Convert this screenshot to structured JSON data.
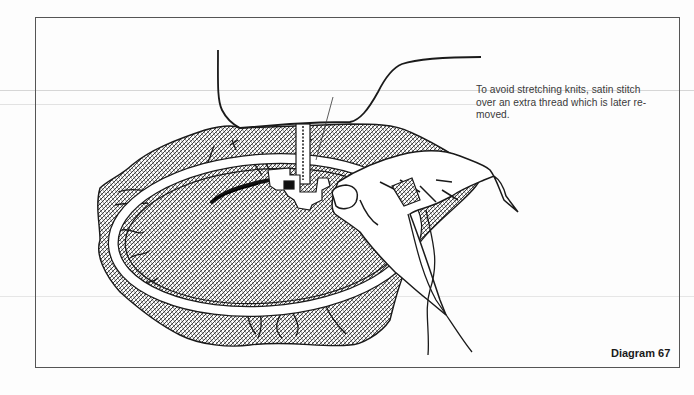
{
  "document": {
    "caption": {
      "lines": [
        "To avoid stretching knits, satin stitch",
        "over an extra thread which is later re-",
        "moved."
      ]
    },
    "figure_label": "Diagram 67",
    "illustration": {
      "subject": "embroidery-hoop-with-knit-fabric-under-sewing-machine-foot",
      "elements": [
        "sewing-machine-outline",
        "presser-foot",
        "needle-thread",
        "hatched-knit-fabric",
        "embroidery-hoop",
        "satin-stitch-line",
        "hand-holding-extra-thread",
        "hanging-thread-ends"
      ]
    },
    "colors": {
      "ink": "#1a1a1a",
      "frame": "#555555",
      "caption_text": "#3a3a3a",
      "paper": "#fdfdfd"
    }
  }
}
